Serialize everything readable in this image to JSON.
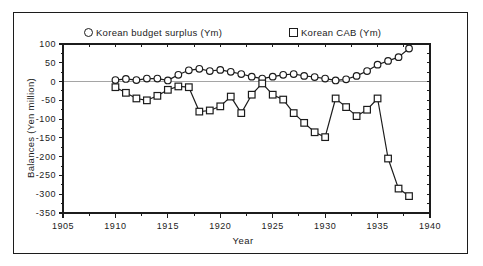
{
  "figure": {
    "background_color": "#ffffff",
    "frame_color": "#1c1c1c"
  },
  "legend": {
    "position": "top",
    "items": [
      {
        "marker": "circle-icon",
        "label": "Korean budget surplus (Ym)"
      },
      {
        "marker": "square-icon",
        "label": "Korean CAB (Ym)"
      }
    ]
  },
  "chart_data": {
    "type": "line",
    "title": "",
    "xlabel": "Year",
    "ylabel": "Balances (Yen million)",
    "xlim": [
      1905,
      1940
    ],
    "ylim": [
      -350,
      100
    ],
    "x_major_ticks": [
      1905,
      1910,
      1915,
      1920,
      1925,
      1930,
      1935,
      1940
    ],
    "x_minor_step": 2.5,
    "y_major_ticks": [
      100,
      50,
      0,
      -50,
      -100,
      -150,
      -200,
      -250,
      -300,
      -350
    ],
    "y_minor_step": 25,
    "grid": "horizontal zero line only",
    "zero_line": true,
    "x": [
      1910,
      1911,
      1912,
      1913,
      1914,
      1915,
      1916,
      1917,
      1918,
      1919,
      1920,
      1921,
      1922,
      1923,
      1924,
      1925,
      1926,
      1927,
      1928,
      1929,
      1930,
      1931,
      1932,
      1933,
      1934,
      1935,
      1936,
      1937,
      1938
    ],
    "series": [
      {
        "name": "Korean budget surplus (Ym)",
        "marker": "circle",
        "values": [
          4,
          7,
          4,
          8,
          8,
          3,
          18,
          30,
          34,
          28,
          31,
          26,
          20,
          13,
          8,
          13,
          18,
          20,
          15,
          12,
          8,
          3,
          6,
          15,
          28,
          45,
          55,
          65,
          88
        ]
      },
      {
        "name": "Korean CAB (Ym)",
        "marker": "square",
        "values": [
          -15,
          -30,
          -45,
          -50,
          -38,
          -22,
          -13,
          -15,
          -80,
          -77,
          -66,
          -40,
          -84,
          -35,
          -5,
          -35,
          -48,
          -84,
          -110,
          -135,
          -148,
          -45,
          -68,
          -92,
          -75,
          -45,
          -205,
          -285,
          -305
        ]
      }
    ]
  }
}
